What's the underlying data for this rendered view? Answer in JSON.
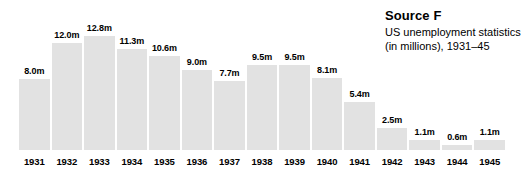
{
  "source": {
    "title": "Source F",
    "description": "US unemployment statistics (in millions), 1931–45"
  },
  "chart_data": {
    "type": "bar",
    "title": "Source F",
    "subtitle": "US unemployment statistics (in millions), 1931–45",
    "xlabel": "",
    "ylabel": "",
    "ylim": [
      0,
      12.8
    ],
    "grid": false,
    "legend": false,
    "bar_color": "#e2e2e2",
    "categories": [
      "1931",
      "1932",
      "1933",
      "1934",
      "1935",
      "1936",
      "1937",
      "1938",
      "1939",
      "1940",
      "1941",
      "1942",
      "1943",
      "1944",
      "1945"
    ],
    "values": [
      8.0,
      12.0,
      12.8,
      11.3,
      10.6,
      9.0,
      7.7,
      9.5,
      9.5,
      8.1,
      5.4,
      2.5,
      1.1,
      0.6,
      1.1
    ],
    "data_labels": [
      "8.0m",
      "12.0m",
      "12.8m",
      "11.3m",
      "10.6m",
      "9.0m",
      "7.7m",
      "9.5m",
      "9.5m",
      "8.1m",
      "5.4m",
      "2.5m",
      "1.1m",
      "0.6m",
      "1.1m"
    ]
  }
}
